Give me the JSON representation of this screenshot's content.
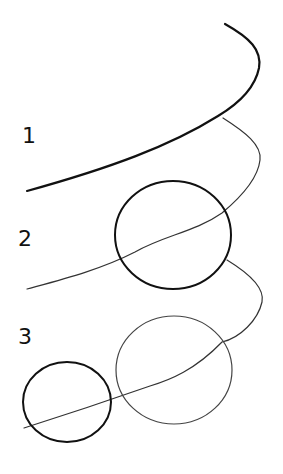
{
  "diagram": {
    "steps": [
      {
        "label": "1",
        "elements": [
          "bold arc"
        ]
      },
      {
        "label": "2",
        "elements": [
          "thin arc",
          "bold oval"
        ]
      },
      {
        "label": "3",
        "elements": [
          "thin arc",
          "thin oval",
          "bold oval"
        ]
      }
    ],
    "colors": {
      "background": "#ffffff",
      "ink_bold": "#111111",
      "ink_thin": "#333333"
    }
  }
}
